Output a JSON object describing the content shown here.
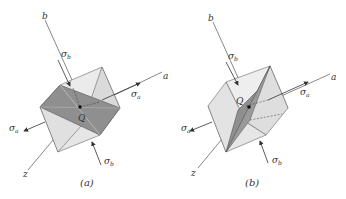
{
  "figure_a": {
    "caption": "(a)",
    "axis_labels": {
      "a": "a",
      "b": "b",
      "z": "z"
    },
    "stress_labels": {
      "sigma_a": "σ",
      "sigma_a_sub": "a",
      "sigma_b": "σ",
      "sigma_b_sub": "b"
    },
    "point_label": "Q"
  },
  "figure_b": {
    "caption": "(b)",
    "axis_labels": {
      "a": "a",
      "b": "b",
      "z": "z"
    },
    "stress_labels": {
      "sigma_a": "σ",
      "sigma_a_sub": "a",
      "sigma_b": "σ",
      "sigma_b_sub": "b"
    },
    "point_label": "Q"
  },
  "colors": {
    "cube_light": "#e8e8e8",
    "cube_mid": "#d4d4d4",
    "cube_dark": "#c4c4c4",
    "plane_shade": "#8a8a8a",
    "line": "#555555"
  }
}
